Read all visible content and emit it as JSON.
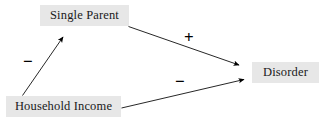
{
  "diagram": {
    "background_color": "#ffffff",
    "node_fill_color": "#e7e7e7",
    "text_color": "#1a1a1a",
    "edge_color": "#000000",
    "nodes": [
      {
        "id": "single-parent",
        "label": "Single Parent"
      },
      {
        "id": "household-income",
        "label": "Household Income"
      },
      {
        "id": "disorder",
        "label": "Disorder"
      }
    ],
    "edges": [
      {
        "id": "income-to-parent",
        "from": "Household Income",
        "to": "Single Parent",
        "sign": "−",
        "sign_meaning": "negative"
      },
      {
        "id": "parent-to-disorder",
        "from": "Single Parent",
        "to": "Disorder",
        "sign": "+",
        "sign_meaning": "positive"
      },
      {
        "id": "income-to-disorder",
        "from": "Household Income",
        "to": "Disorder",
        "sign": "−",
        "sign_meaning": "negative"
      }
    ]
  }
}
